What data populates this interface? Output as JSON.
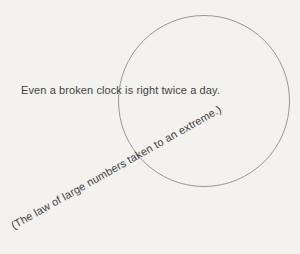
{
  "page": {
    "background_color": "#f4f2ef"
  },
  "diagram": {
    "type": "euler-circle-comic",
    "circle": {
      "stroke_color": "#979797"
    },
    "caption": "Even a broken clock is right twice a day.",
    "note": "(The law of large numbers taken to an extreme.)",
    "note_rotation_deg": -29.5,
    "text_color": "#3f3f3f"
  }
}
